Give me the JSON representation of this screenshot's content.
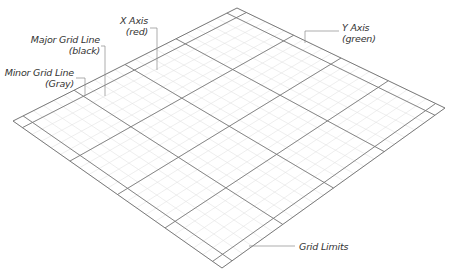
{
  "diagram": {
    "type": "isometric-grid-plane",
    "colors": {
      "background": "#ffffff",
      "major_line": "#7a7a7a",
      "minor_line": "#e2e2e2",
      "leader_line": "#8a8a8a",
      "label_text": "#333333"
    },
    "labels": {
      "major_grid_line": {
        "line1": "Major Grid Line",
        "line2": "(black)"
      },
      "minor_grid_line": {
        "line1": "Minor Grid Line",
        "line2": "(Gray)"
      },
      "x_axis": {
        "line1": "X Axis",
        "line2": "(red)"
      },
      "y_axis": {
        "line1": "Y Axis",
        "line2": "(green)"
      },
      "grid_limits": {
        "line1": "Grid Limits"
      }
    },
    "grid": {
      "major_divisions_u": 4,
      "major_divisions_v": 4,
      "minor_per_major": 5,
      "has_border_band": true
    }
  }
}
